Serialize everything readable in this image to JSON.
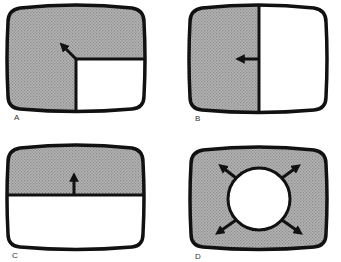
{
  "figure": {
    "colors": {
      "frame": "#111111",
      "shaded": "#a9a9a9",
      "clear": "#ffffff",
      "label": "#333333"
    },
    "panels": [
      {
        "id": "A",
        "label": "A",
        "wipe": "corner wipe toward top-left",
        "arrow_direction": "up-left"
      },
      {
        "id": "B",
        "label": "B",
        "wipe": "vertical edge wipe toward left",
        "arrow_direction": "left"
      },
      {
        "id": "C",
        "label": "C",
        "wipe": "horizontal edge wipe upward",
        "arrow_direction": "up"
      },
      {
        "id": "D",
        "label": "D",
        "wipe": "circular iris wipe expanding outward",
        "arrow_direction": "outward (4 diagonals)"
      }
    ]
  }
}
